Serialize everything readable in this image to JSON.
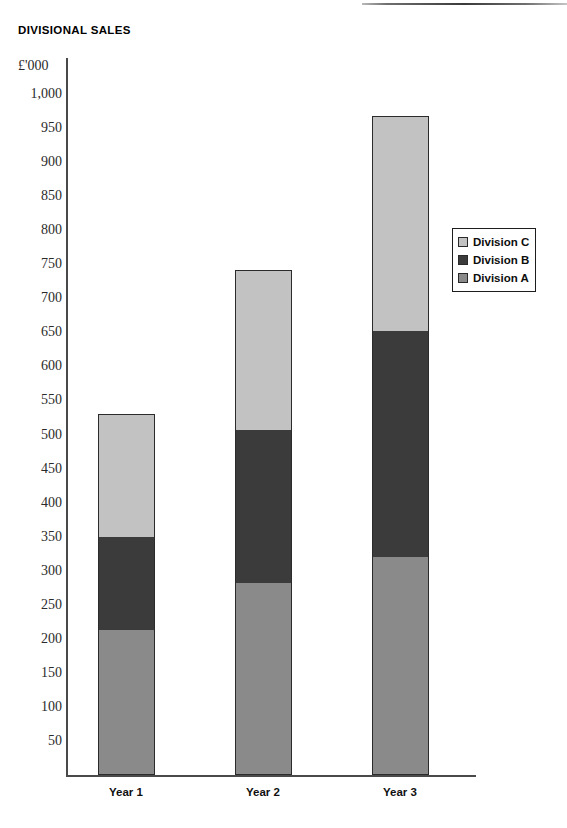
{
  "document": {
    "top_rule_present": true
  },
  "chart_data": {
    "type": "bar",
    "subtype": "stacked-bar",
    "title": "DIVISIONAL SALES",
    "unit_label": "£'000",
    "xlabel": "",
    "ylabel": "£'000",
    "categories": [
      "Year 1",
      "Year 2",
      "Year 3"
    ],
    "series": [
      {
        "name": "Division A",
        "color": "#8a8a8a",
        "values": [
          212,
          281,
          320
        ]
      },
      {
        "name": "Division B",
        "color": "#3b3b3b",
        "values": [
          138,
          226,
          333
        ]
      },
      {
        "name": "Division C",
        "color": "#c2c2c2",
        "values": [
          180,
          235,
          314
        ]
      }
    ],
    "stack_order_bottom_to_top": [
      "Division A",
      "Division B",
      "Division C"
    ],
    "totals": [
      530,
      742,
      967
    ],
    "cumulative_tops": [
      {
        "category": "Year 1",
        "a_top": 212,
        "b_top": 350,
        "c_top": 530
      },
      {
        "category": "Year 2",
        "a_top": 281,
        "b_top": 507,
        "c_top": 742
      },
      {
        "category": "Year 3",
        "a_top": 320,
        "b_top": 653,
        "c_top": 967
      }
    ],
    "ylim": [
      0,
      1000
    ],
    "ytick_step": 50,
    "ytick_labels": [
      "1,000",
      "950",
      "900",
      "850",
      "800",
      "750",
      "700",
      "650",
      "600",
      "550",
      "500",
      "450",
      "400",
      "350",
      "300",
      "250",
      "200",
      "150",
      "100",
      "50"
    ],
    "ytick_values": [
      1000,
      950,
      900,
      850,
      800,
      750,
      700,
      650,
      600,
      550,
      500,
      450,
      400,
      350,
      300,
      250,
      200,
      150,
      100,
      50
    ],
    "grid": false,
    "legend_position": "right",
    "legend_entries": [
      {
        "label": "Division C",
        "color": "#c2c2c2"
      },
      {
        "label": "Division B",
        "color": "#3b3b3b"
      },
      {
        "label": "Division A",
        "color": "#8a8a8a"
      }
    ]
  }
}
